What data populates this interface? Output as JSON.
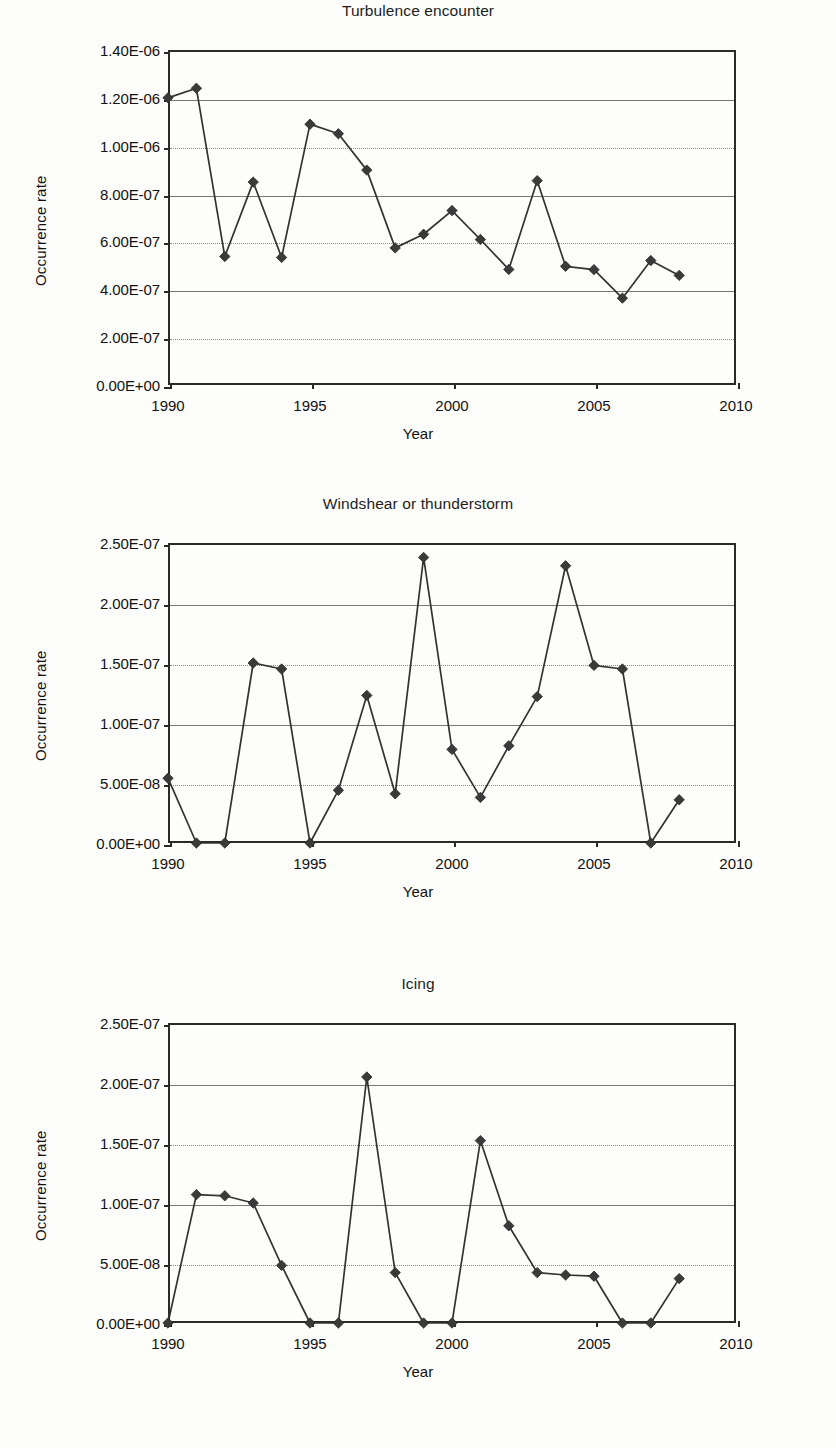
{
  "axis_titles": {
    "x": "Year",
    "y": "Occurrence rate"
  },
  "charts": [
    {
      "id": "turbulence-encounter",
      "title": "Turbulence encounter",
      "y_ticks": [
        "0.00E+00",
        "2.00E-07",
        "4.00E-07",
        "6.00E-07",
        "8.00E-07",
        "1.00E-06",
        "1.20E-06",
        "1.40E-06"
      ],
      "x_ticks": [
        "1990",
        "1995",
        "2000",
        "2005",
        "2010"
      ],
      "chart_data": {
        "type": "line",
        "title": "Turbulence encounter",
        "xlabel": "Year",
        "ylabel": "Occurrence rate",
        "xlim": [
          1990,
          2010
        ],
        "ylim": [
          0,
          1.4e-06
        ],
        "ytick_values": [
          0,
          2e-07,
          4e-07,
          6e-07,
          8e-07,
          1e-06,
          1.2e-06,
          1.4e-06
        ],
        "xtick_values": [
          1990,
          1995,
          2000,
          2005,
          2010
        ],
        "grid": true,
        "legend": "none",
        "marker": "diamond",
        "x": [
          1990,
          1991,
          1992,
          1993,
          1994,
          1995,
          1996,
          1997,
          1998,
          1999,
          2000,
          2001,
          2002,
          2003,
          2004,
          2005,
          2006,
          2007,
          2008
        ],
        "values": [
          1.2e-06,
          1.24e-06,
          5.37e-07,
          8.48e-07,
          5.33e-07,
          1.09e-06,
          1.05e-06,
          8.98e-07,
          5.73e-07,
          6.3e-07,
          7.29e-07,
          6.08e-07,
          4.83e-07,
          8.54e-07,
          4.96e-07,
          4.82e-07,
          3.63e-07,
          5.2e-07,
          4.58e-07
        ]
      }
    },
    {
      "id": "windshear-or-thunderstorm",
      "title": "Windshear or thunderstorm",
      "y_ticks": [
        "0.00E+00",
        "5.00E-08",
        "1.00E-07",
        "1.50E-07",
        "2.00E-07",
        "2.50E-07"
      ],
      "x_ticks": [
        "1990",
        "1995",
        "2000",
        "2005",
        "2010"
      ],
      "chart_data": {
        "type": "line",
        "title": "Windshear or thunderstorm",
        "xlabel": "Year",
        "ylabel": "Occurrence rate",
        "xlim": [
          1990,
          2010
        ],
        "ylim": [
          0,
          2.5e-07
        ],
        "ytick_values": [
          0,
          5e-08,
          1e-07,
          1.5e-07,
          2e-07,
          2.5e-07
        ],
        "xtick_values": [
          1990,
          1995,
          2000,
          2005,
          2010
        ],
        "grid": true,
        "legend": "none",
        "marker": "diamond",
        "x": [
          1990,
          1991,
          1992,
          1993,
          1994,
          1995,
          1996,
          1997,
          1998,
          1999,
          2000,
          2001,
          2002,
          2003,
          2004,
          2005,
          2006,
          2007,
          2008
        ],
        "values": [
          5.4e-08,
          0.0,
          0.0,
          1.5e-07,
          1.45e-07,
          0.0,
          4.4e-08,
          1.23e-07,
          4.1e-08,
          2.38e-07,
          7.8e-08,
          3.8e-08,
          8.1e-08,
          1.22e-07,
          2.31e-07,
          1.48e-07,
          1.45e-07,
          0.0,
          3.6e-08
        ]
      }
    },
    {
      "id": "icing",
      "title": "Icing",
      "y_ticks": [
        "0.00E+00",
        "5.00E-08",
        "1.00E-07",
        "1.50E-07",
        "2.00E-07",
        "2.50E-07"
      ],
      "x_ticks": [
        "1990",
        "1995",
        "2000",
        "2005",
        "2010"
      ],
      "chart_data": {
        "type": "line",
        "title": "Icing",
        "xlabel": "Year",
        "ylabel": "Occurrence rate",
        "xlim": [
          1990,
          2010
        ],
        "ylim": [
          0,
          2.5e-07
        ],
        "ytick_values": [
          0,
          5e-08,
          1e-07,
          1.5e-07,
          2e-07,
          2.5e-07
        ],
        "xtick_values": [
          1990,
          1995,
          2000,
          2005,
          2010
        ],
        "grid": true,
        "legend": "none",
        "marker": "diamond",
        "x": [
          1990,
          1991,
          1992,
          1993,
          1994,
          1995,
          1996,
          1997,
          1998,
          1999,
          2000,
          2001,
          2002,
          2003,
          2004,
          2005,
          2006,
          2007,
          2008
        ],
        "values": [
          0.0,
          1.07e-07,
          1.06e-07,
          1e-07,
          4.8e-08,
          0.0,
          0.0,
          2.05e-07,
          4.2e-08,
          0.0,
          0.0,
          1.52e-07,
          8.1e-08,
          4.2e-08,
          4e-08,
          3.9e-08,
          0.0,
          0.0,
          3.7e-08
        ]
      }
    }
  ]
}
